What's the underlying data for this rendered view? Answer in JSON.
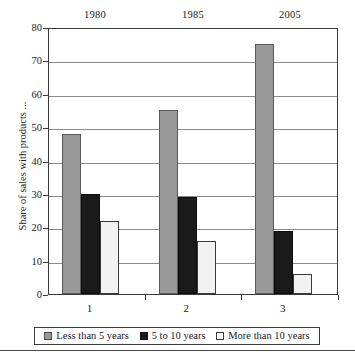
{
  "chart_data": {
    "type": "bar",
    "title": "",
    "subtitle": "",
    "xlabel": "",
    "ylabel": "Share of sales with products ...",
    "categories": [
      "1",
      "2",
      "3"
    ],
    "top_labels": [
      "1980",
      "1985",
      "2005"
    ],
    "ylim": [
      0,
      80
    ],
    "yticks": [
      0,
      10,
      20,
      30,
      40,
      50,
      60,
      70,
      80
    ],
    "ytick_labels": [
      "0",
      "10",
      "20",
      "30",
      "40",
      "50",
      "60",
      "70",
      "80"
    ],
    "grid": true,
    "grid_axis": "y",
    "legend_position": "bottom",
    "series": [
      {
        "name": "Less than 5 years",
        "color": "#999999",
        "values": [
          48,
          55,
          75
        ]
      },
      {
        "name": "5 to 10 years",
        "color": "#1a1a1a",
        "values": [
          30,
          29,
          19
        ]
      },
      {
        "name": "More than 10 years",
        "color": "#f2f2f2",
        "values": [
          22,
          16,
          6
        ]
      }
    ]
  },
  "legend": {
    "items": [
      {
        "label": "Less than 5 years"
      },
      {
        "label": "5 to 10 years"
      },
      {
        "label": "More than 10 years"
      }
    ]
  },
  "colors": {
    "series_less_than_5": "#999999",
    "series_5_to_10": "#1a1a1a",
    "series_more_than_10": "#f2f2f2",
    "axis": "#3a3a3a",
    "grid": "#8a8a8a",
    "text": "#1a1a1a",
    "background": "#ffffff"
  }
}
